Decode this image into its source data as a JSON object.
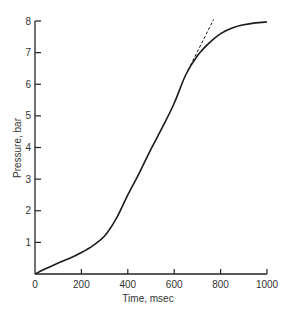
{
  "chart_data": {
    "type": "line",
    "title": "",
    "xlabel": "Time, msec",
    "ylabel": "Pressure, bar",
    "xlim": [
      0,
      1000
    ],
    "ylim": [
      0,
      8
    ],
    "xticks": [
      0,
      200,
      400,
      600,
      800,
      1000
    ],
    "xtick_labels": [
      "0",
      "200",
      "400",
      "600",
      "800",
      "1000"
    ],
    "yticks": [
      1,
      2,
      3,
      4,
      5,
      6,
      7,
      8
    ],
    "ytick_labels": [
      "1",
      "2",
      "3",
      "4",
      "5",
      "6",
      "7",
      "8"
    ],
    "grid": false,
    "series": [
      {
        "name": "pressure",
        "style": "solid",
        "x": [
          0,
          50,
          100,
          150,
          200,
          250,
          300,
          350,
          400,
          450,
          500,
          550,
          600,
          650,
          700,
          750,
          800,
          850,
          900,
          950,
          1000
        ],
        "y": [
          0,
          0.18,
          0.35,
          0.5,
          0.68,
          0.9,
          1.2,
          1.75,
          2.5,
          3.2,
          3.95,
          4.65,
          5.4,
          6.3,
          6.9,
          7.3,
          7.6,
          7.78,
          7.88,
          7.94,
          7.97
        ]
      },
      {
        "name": "tangent extrapolation",
        "style": "dashed",
        "x": [
          660,
          770
        ],
        "y": [
          6.45,
          8.05
        ]
      }
    ]
  }
}
